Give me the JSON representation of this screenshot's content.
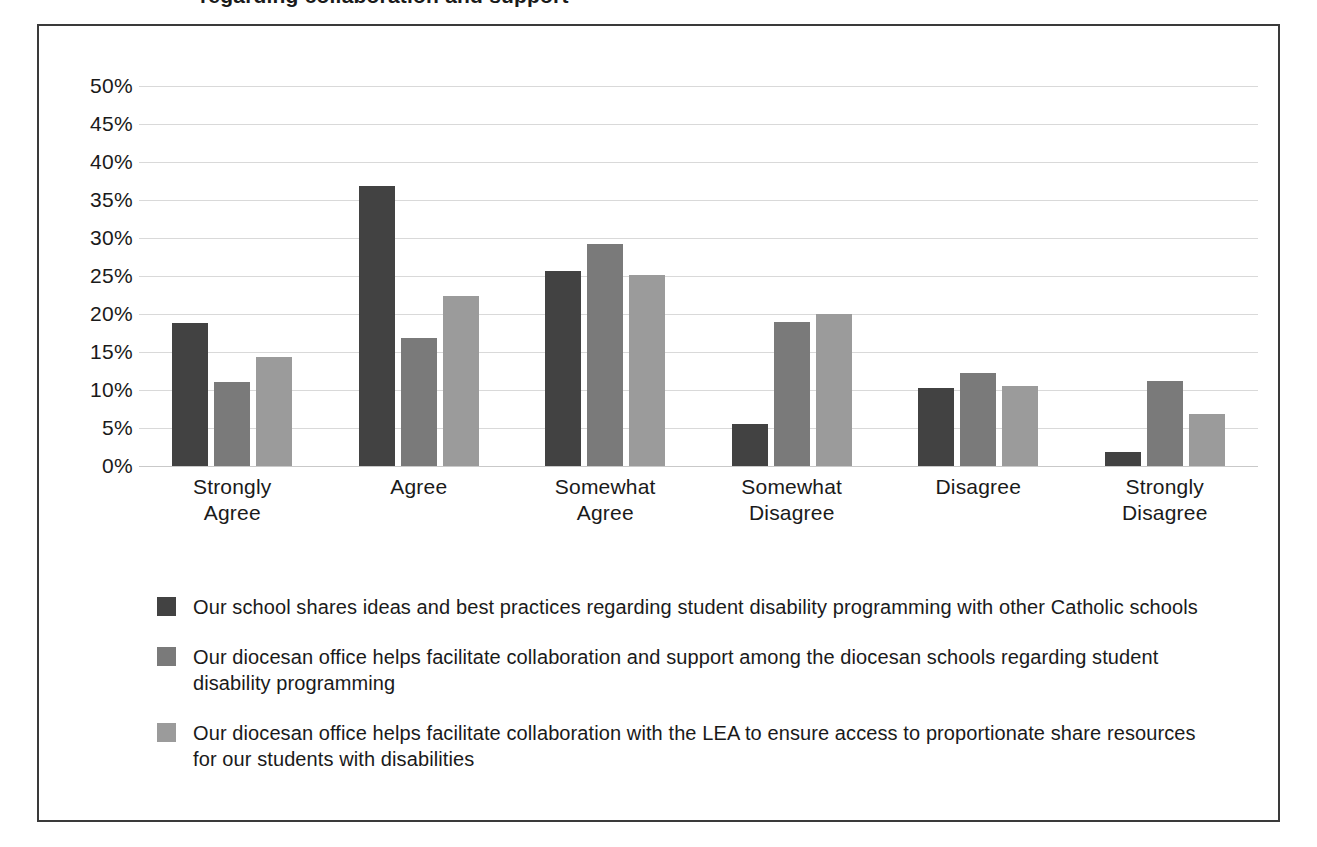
{
  "figure": {
    "title_partial": "regarding collaboration and support",
    "frame_color": "#3a3a3a",
    "background": "#ffffff"
  },
  "chart_data": {
    "type": "bar",
    "title": "",
    "xlabel": "",
    "ylabel": "",
    "ylim": [
      0,
      50
    ],
    "grid": true,
    "legend_position": "bottom",
    "value_format": "percent",
    "categories": [
      "Strongly\nAgree",
      "Agree",
      "Somewhat\nAgree",
      "Somewhat\nDisagree",
      "Disagree",
      "Strongly\nDisagree"
    ],
    "ticks": [
      "50%",
      "45%",
      "40%",
      "35%",
      "30%",
      "25%",
      "20%",
      "15%",
      "10%",
      "5%",
      "0%"
    ],
    "tick_values": [
      50,
      45,
      40,
      35,
      30,
      25,
      20,
      15,
      10,
      5,
      0
    ],
    "series": [
      {
        "name": "Our school shares ideas and best practices regarding student disability programming with other Catholic schools",
        "color": "#424242",
        "values": [
          18.8,
          36.8,
          25.7,
          5.5,
          10.2,
          1.9
        ]
      },
      {
        "name": "Our diocesan office helps facilitate collaboration and support among the diocesan schools regarding student disability programming",
        "color": "#7a7a7a",
        "values": [
          11.0,
          16.8,
          29.2,
          19.0,
          12.3,
          11.2
        ]
      },
      {
        "name": "Our diocesan office helps facilitate collaboration with the LEA to ensure access to proportionate share resources for our students with disabilities",
        "color": "#9b9b9b",
        "values": [
          14.3,
          22.4,
          25.1,
          20.0,
          10.5,
          6.9
        ]
      }
    ]
  }
}
